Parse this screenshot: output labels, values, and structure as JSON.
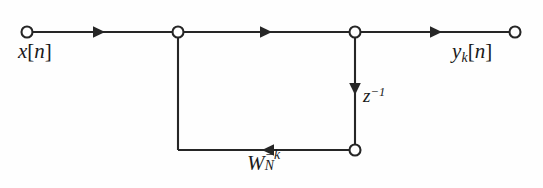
{
  "diagram": {
    "type": "signal-flow-graph",
    "background_color": "#fefefe",
    "line_color": "#262626",
    "node_fill_color": "#ffffff",
    "labels": {
      "input": {
        "base": "x",
        "bracket_open": "[",
        "index": "n",
        "bracket_close": "]"
      },
      "output": {
        "base": "y",
        "subscript": "k",
        "bracket_open": "[",
        "index": "n",
        "bracket_close": "]"
      },
      "delay": {
        "base": "z",
        "superscript": "−1"
      },
      "twiddle": {
        "base": "W",
        "subscript": "N",
        "superscript": "−k"
      }
    },
    "nodes": [
      {
        "name": "input-terminal",
        "x": 27,
        "y": 32,
        "r": 5.5,
        "kind": "terminal"
      },
      {
        "name": "summing-junction",
        "x": 178,
        "y": 32,
        "r": 5.5,
        "kind": "junction"
      },
      {
        "name": "output-branch-node",
        "x": 355,
        "y": 32,
        "r": 5.5,
        "kind": "junction"
      },
      {
        "name": "delay-output-node",
        "x": 355,
        "y": 150,
        "r": 5.5,
        "kind": "junction"
      },
      {
        "name": "output-terminal",
        "x": 515,
        "y": 32,
        "r": 5.5,
        "kind": "terminal"
      }
    ],
    "edges": [
      {
        "name": "input-to-junction",
        "from": "input-terminal",
        "to": "summing-junction",
        "arrow_at": 105,
        "direction": "right"
      },
      {
        "name": "junction-to-branch",
        "from": "summing-junction",
        "to": "output-branch-node",
        "arrow_at": 272,
        "direction": "right"
      },
      {
        "name": "branch-to-output",
        "from": "output-branch-node",
        "to": "output-terminal",
        "arrow_at": 442,
        "direction": "right"
      },
      {
        "name": "delay-branch",
        "from": "output-branch-node",
        "to": "delay-output-node",
        "arrow_at": 95,
        "direction": "down"
      },
      {
        "name": "feedback-horizontal",
        "from": "delay-output-node",
        "to": "feedback-corner",
        "arrow_at": 262,
        "direction": "left"
      },
      {
        "name": "feedback-vertical",
        "from": "feedback-corner",
        "to": "summing-junction",
        "arrow_at": null,
        "direction": "up"
      }
    ]
  }
}
